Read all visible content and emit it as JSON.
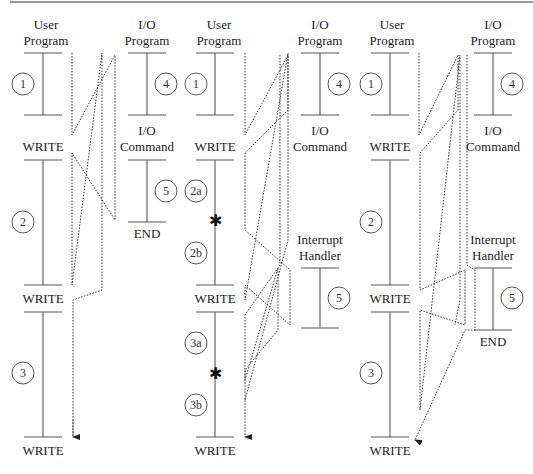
{
  "colors": {
    "line": "#555555",
    "text": "#222222",
    "dotted": "#333333",
    "background": "#ffffff"
  },
  "panels": [
    {
      "id": "a",
      "user_program_title_1": "User",
      "user_program_title_2": "Program",
      "io_program_title_1": "I/O",
      "io_program_title_2": "Program",
      "io_command_1": "I/O",
      "io_command_2": "Command",
      "end_label": "END",
      "write_labels": [
        "WRITE",
        "WRITE",
        "WRITE"
      ],
      "segments": [
        "1",
        "2",
        "3"
      ],
      "io_segments": [
        "4",
        "5"
      ]
    },
    {
      "id": "b",
      "user_program_title_1": "User",
      "user_program_title_2": "Program",
      "io_program_title_1": "I/O",
      "io_program_title_2": "Program",
      "io_command_1": "I/O",
      "io_command_2": "Command",
      "handler_title_1": "Interrupt",
      "handler_title_2": "Handler",
      "write_labels": [
        "WRITE",
        "WRITE",
        "WRITE"
      ],
      "segments": [
        "1",
        "2a",
        "2b",
        "3a",
        "3b"
      ],
      "io_segments": [
        "4",
        "5"
      ],
      "interrupt_marker": "✱"
    },
    {
      "id": "c",
      "user_program_title_1": "User",
      "user_program_title_2": "Program",
      "io_program_title_1": "I/O",
      "io_program_title_2": "Program",
      "io_command_1": "I/O",
      "io_command_2": "Command",
      "handler_title_1": "Interrupt",
      "handler_title_2": "Handler",
      "end_label": "END",
      "write_labels": [
        "WRITE",
        "WRITE",
        "WRITE"
      ],
      "segments": [
        "1",
        "2",
        "3"
      ],
      "io_segments": [
        "4",
        "5"
      ]
    }
  ]
}
